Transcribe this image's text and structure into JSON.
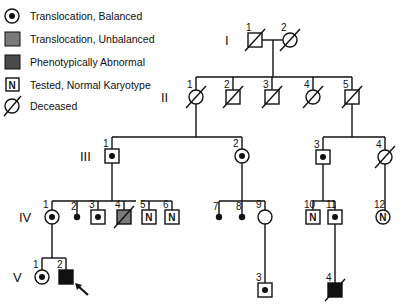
{
  "legend": [
    {
      "symbol": "carrier-circle",
      "label": "Translocation, Balanced"
    },
    {
      "symbol": "unbalanced-square",
      "label": "Translocation, Unbalanced"
    },
    {
      "symbol": "abnormal-square",
      "label": "Phenotypically Abnormal"
    },
    {
      "symbol": "tested-square",
      "label": "Tested, Normal Karyotype",
      "mark": "N"
    },
    {
      "symbol": "deceased-circle",
      "label": "Deceased"
    }
  ],
  "colors": {
    "ink": "#111111",
    "unbalanced_fill": "#7a7a7a",
    "abnormal_fill": "#4a4a4a",
    "affected_fill": "#111111"
  },
  "generations": [
    "I",
    "II",
    "III",
    "IV",
    "V"
  ],
  "individuals": [
    {
      "id": "I-1",
      "num": "1",
      "sex": "male",
      "status": "deceased"
    },
    {
      "id": "I-2",
      "num": "2",
      "sex": "female",
      "status": "deceased"
    },
    {
      "id": "II-1",
      "num": "1",
      "sex": "female",
      "status": "deceased"
    },
    {
      "id": "II-2",
      "num": "2",
      "sex": "male",
      "status": "deceased"
    },
    {
      "id": "II-3",
      "num": "3",
      "sex": "male",
      "status": "deceased"
    },
    {
      "id": "II-4",
      "num": "4",
      "sex": "female",
      "status": "deceased"
    },
    {
      "id": "II-5",
      "num": "5",
      "sex": "male",
      "status": "deceased"
    },
    {
      "id": "III-1",
      "num": "1",
      "sex": "male",
      "status": "balanced"
    },
    {
      "id": "III-2",
      "num": "2",
      "sex": "female",
      "status": "balanced"
    },
    {
      "id": "III-3",
      "num": "3",
      "sex": "male",
      "status": "balanced"
    },
    {
      "id": "III-4",
      "num": "4",
      "sex": "female",
      "status": "deceased"
    },
    {
      "id": "IV-1",
      "num": "1",
      "sex": "female",
      "status": "balanced"
    },
    {
      "id": "IV-2",
      "num": "2",
      "sex": "miscarriage",
      "status": "pregnancy-loss"
    },
    {
      "id": "IV-3",
      "num": "3",
      "sex": "male",
      "status": "balanced"
    },
    {
      "id": "IV-4",
      "num": "4",
      "sex": "male",
      "status": "unbalanced-deceased"
    },
    {
      "id": "IV-5",
      "num": "5",
      "sex": "male",
      "status": "tested-normal",
      "mark": "N"
    },
    {
      "id": "IV-6",
      "num": "6",
      "sex": "male",
      "status": "tested-normal",
      "mark": "N"
    },
    {
      "id": "IV-7",
      "num": "7",
      "sex": "miscarriage",
      "status": "pregnancy-loss"
    },
    {
      "id": "IV-8",
      "num": "8",
      "sex": "miscarriage",
      "status": "pregnancy-loss"
    },
    {
      "id": "IV-9",
      "num": "9",
      "sex": "female",
      "status": "unaffected"
    },
    {
      "id": "IV-10",
      "num": "10",
      "sex": "male",
      "status": "tested-normal",
      "mark": "N"
    },
    {
      "id": "IV-11",
      "num": "11",
      "sex": "male",
      "status": "balanced"
    },
    {
      "id": "IV-12",
      "num": "12",
      "sex": "female",
      "status": "tested-normal",
      "mark": "N"
    },
    {
      "id": "V-1",
      "num": "1",
      "sex": "female",
      "status": "balanced"
    },
    {
      "id": "V-2",
      "num": "2",
      "sex": "male",
      "status": "affected-proband"
    },
    {
      "id": "V-3",
      "num": "3",
      "sex": "male",
      "status": "balanced"
    },
    {
      "id": "V-4",
      "num": "4",
      "sex": "male",
      "status": "affected-deceased"
    }
  ],
  "proband": "V-2"
}
